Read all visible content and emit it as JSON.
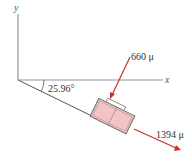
{
  "axes": {
    "x_label": "x",
    "y_label": "y"
  },
  "angle": {
    "label": "25.96°",
    "value_deg": 25.96
  },
  "vectors": [
    {
      "label": "660 μ",
      "direction": "into block (compression)",
      "color": "#c0392b"
    },
    {
      "label": "1394 μ",
      "direction": "along incline, away from origin",
      "color": "#c0392b"
    }
  ],
  "colors": {
    "axis": "#7a8a9a",
    "incline": "#555555",
    "block_fill": "#f2c4c4",
    "block_stroke": "#6b6b6b",
    "arrow": "#c8312b"
  }
}
